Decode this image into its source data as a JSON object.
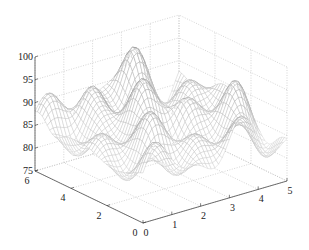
{
  "chart_data": {
    "type": "surface",
    "style": "mesh",
    "title": "",
    "xlabel": "",
    "ylabel": "",
    "zlabel": "",
    "xlim": [
      0,
      5
    ],
    "ylim": [
      0,
      6
    ],
    "zlim": [
      75,
      100
    ],
    "x_ticks": [
      "0",
      "1",
      "2",
      "3",
      "4",
      "5"
    ],
    "y_ticks": [
      "0",
      "2",
      "4",
      "6"
    ],
    "z_ticks": [
      "75",
      "80",
      "85",
      "90",
      "95",
      "100"
    ],
    "grid": true,
    "grid_style": "dotted",
    "mesh_color": "#333333",
    "surface_peaks": [
      {
        "x": 1.5,
        "y": 5.5,
        "z": 99
      },
      {
        "x": 3.0,
        "y": 5.5,
        "z": 99
      },
      {
        "x": 2.0,
        "y": 3.5,
        "z": 95
      },
      {
        "x": 3.0,
        "y": 3.0,
        "z": 94
      },
      {
        "x": 1.5,
        "y": 1.5,
        "z": 90
      },
      {
        "x": 4.5,
        "y": 2.0,
        "z": 92
      }
    ],
    "surface_troughs": [
      {
        "x": 0.2,
        "y": 5.0,
        "z": 79
      },
      {
        "x": 1.0,
        "y": 1.0,
        "z": 80
      },
      {
        "x": 5.0,
        "y": 1.0,
        "z": 79
      }
    ]
  }
}
